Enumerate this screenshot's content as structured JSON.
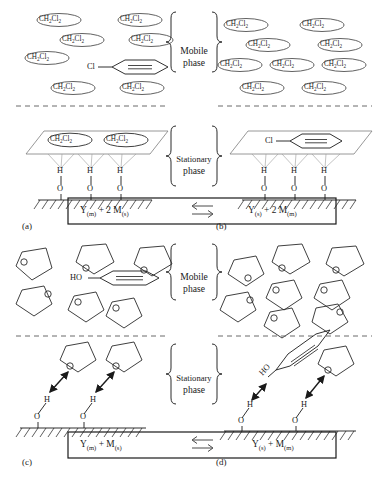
{
  "figure": {
    "panels": [
      {
        "tag": "(a)",
        "description": "chlorobenzene solute in dichloromethane mobile phase"
      },
      {
        "tag": "(b)",
        "description": "chlorobenzene solute adsorbed on stationary phase"
      },
      {
        "tag": "(c)",
        "description": "phenol solute in tetrahydrofuran mobile phase"
      },
      {
        "tag": "(d)",
        "description": "phenol solute hydrogen bonded to stationary phase"
      }
    ]
  },
  "phase_labels": {
    "mobile_line1": "Mobile",
    "mobile_line2": "phase",
    "stationary_line1": "Stationary",
    "stationary_line2": "phase"
  },
  "solvents": {
    "dichloromethane": "CH2Cl2",
    "dichloromethane_html": "CH<sub>2</sub>Cl<sub>2</sub>"
  },
  "atoms": {
    "hydrogen": "H",
    "oxygen": "O",
    "chlorine": "Cl",
    "hydroxyl": "HO"
  },
  "panel_a": {
    "tag": "(a)",
    "mobile_solvent_count": 7,
    "stationary_solvent_count": 2,
    "solute": "Cl",
    "surface_sites": 3
  },
  "panel_b": {
    "tag": "(b)",
    "mobile_solvent_count": 9,
    "stationary_solvent_count": 0,
    "solute": "Cl",
    "surface_sites": 3
  },
  "panel_c": {
    "tag": "(c)",
    "mobile_solvent_count": 6,
    "stationary_solvent_count": 2,
    "solute": "HO",
    "surface_sites": 2
  },
  "panel_d": {
    "tag": "(d)",
    "mobile_solvent_count": 7,
    "stationary_solvent_count": 1,
    "solute": "HO",
    "surface_sites": 2
  },
  "equation_top": {
    "left_Y": "Y",
    "left_Y_sub": "(m)",
    "left_plus": "+ 2 M",
    "left_M_sub": "(s)",
    "left_full": "Y(m) + 2 M(s)",
    "right_Y": "Y",
    "right_Y_sub": "(s)",
    "right_plus": "+ 2 M",
    "right_M_sub": "(m)",
    "right_full": "Y(s) + 2 M(m)",
    "arrow": "equilibrium-double-arrow"
  },
  "equation_bottom": {
    "left_Y": "Y",
    "left_Y_sub": "(m)",
    "left_plus": "+ M",
    "left_M_sub": "(s)",
    "left_full": "Y(m) + M(s)",
    "right_Y": "Y",
    "right_Y_sub": "(s)",
    "right_plus": "+ M",
    "right_M_sub": "(m)",
    "right_full": "Y(s) + M(m)",
    "arrow": "equilibrium-double-arrow"
  },
  "colors": {
    "ink": "#1a1a1a",
    "line": "#2a2a2a",
    "faint": "#8a8a8a",
    "background": "#ffffff"
  }
}
